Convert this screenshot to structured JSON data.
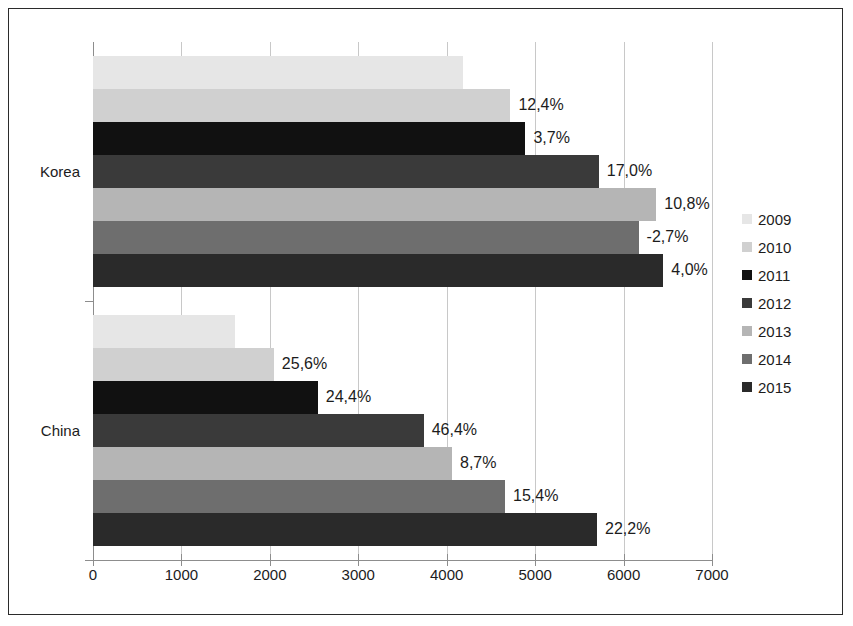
{
  "chart_data": {
    "type": "bar",
    "orientation": "horizontal",
    "title": "",
    "xlabel": "",
    "ylabel": "",
    "xlim": [
      0,
      7000
    ],
    "xticks": [
      0,
      1000,
      2000,
      3000,
      4000,
      5000,
      6000,
      7000
    ],
    "xtick_labels": [
      "0",
      "1000",
      "2000",
      "3000",
      "4000",
      "5000",
      "6000",
      "7000"
    ],
    "grid": true,
    "legend_position": "right",
    "categories": [
      "Korea",
      "China"
    ],
    "series": [
      {
        "name": "2009",
        "color": "#e6e6e6",
        "values": [
          4180,
          1605
        ],
        "data_labels": [
          "",
          ""
        ]
      },
      {
        "name": "2010",
        "color": "#d0d0d0",
        "values": [
          4720,
          2045
        ],
        "data_labels": [
          "12,4%",
          "25,6%"
        ]
      },
      {
        "name": "2011",
        "color": "#111111",
        "values": [
          4890,
          2542
        ],
        "data_labels": [
          "3,7%",
          "24,4%"
        ]
      },
      {
        "name": "2012",
        "color": "#3a3a3a",
        "values": [
          5720,
          3740
        ],
        "data_labels": [
          "17,0%",
          "46,4%"
        ]
      },
      {
        "name": "2013",
        "color": "#b5b5b5",
        "values": [
          6370,
          4060
        ],
        "data_labels": [
          "10,8%",
          "8,7%"
        ]
      },
      {
        "name": "2014",
        "color": "#6e6e6e",
        "values": [
          6170,
          4660
        ],
        "data_labels": [
          "-2,7%",
          "15,4%"
        ]
      },
      {
        "name": "2015",
        "color": "#2a2a2a",
        "values": [
          6450,
          5700
        ],
        "data_labels": [
          "4,0%",
          "22,2%"
        ]
      }
    ]
  },
  "legend": {
    "items": [
      {
        "label": "2009",
        "color": "#e6e6e6"
      },
      {
        "label": "2010",
        "color": "#d0d0d0"
      },
      {
        "label": "2011",
        "color": "#111111"
      },
      {
        "label": "2012",
        "color": "#3a3a3a"
      },
      {
        "label": "2013",
        "color": "#b5b5b5"
      },
      {
        "label": "2014",
        "color": "#6e6e6e"
      },
      {
        "label": "2015",
        "color": "#2a2a2a"
      }
    ]
  },
  "axis": {
    "category_labels": [
      "Korea",
      "China"
    ]
  },
  "colors": {
    "frame": "#2b2b2b",
    "axis": "#8d8d8d",
    "grid": "#c8c8c8",
    "text": "#1c1c1c",
    "background": "#ffffff"
  }
}
